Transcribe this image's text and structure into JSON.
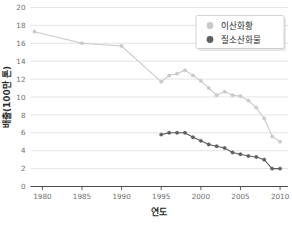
{
  "chart_data": {
    "type": "line",
    "title": "",
    "xlabel": "연도",
    "ylabel": "배출(100만 톤)",
    "xlim": [
      1978.5,
      2011
    ],
    "ylim": [
      0,
      20
    ],
    "xticks": [
      1980,
      1985,
      1990,
      1995,
      2000,
      2005,
      2010
    ],
    "yticks": [
      0,
      2,
      4,
      6,
      8,
      10,
      12,
      14,
      16,
      18,
      20
    ],
    "grid": "horizontal",
    "legend_position": "top-right",
    "series": [
      {
        "name": "이산화황",
        "color": "#c9c9c9",
        "marker": "circle",
        "x": [
          1979,
          1985,
          1990,
          1995,
          1996,
          1997,
          1998,
          1999,
          2000,
          2001,
          2002,
          2003,
          2004,
          2005,
          2006,
          2007,
          2008,
          2009,
          2010
        ],
        "values": [
          17.3,
          16.0,
          15.7,
          11.7,
          12.4,
          12.6,
          13.0,
          12.4,
          11.8,
          11.0,
          10.2,
          10.6,
          10.2,
          10.1,
          9.6,
          8.8,
          7.6,
          5.6,
          5.0
        ]
      },
      {
        "name": "질소산화물",
        "color": "#5e5e5e",
        "marker": "circle",
        "x": [
          1995,
          1996,
          1997,
          1998,
          1999,
          2000,
          2001,
          2002,
          2003,
          2004,
          2005,
          2006,
          2007,
          2008,
          2009,
          2010
        ],
        "values": [
          5.8,
          6.0,
          6.0,
          6.0,
          5.5,
          5.1,
          4.7,
          4.5,
          4.3,
          3.8,
          3.6,
          3.4,
          3.3,
          3.0,
          2.0,
          2.0
        ]
      }
    ]
  },
  "legend": {
    "items": [
      {
        "label": "이산화황",
        "color": "#c9c9c9"
      },
      {
        "label": "질소산화물",
        "color": "#5e5e5e"
      }
    ]
  },
  "axes": {
    "x_title": "연도",
    "y_title": "배출(100만 톤)",
    "x_tick_labels": [
      "1980",
      "1985",
      "1990",
      "1995",
      "2000",
      "2005",
      "2010"
    ],
    "y_tick_labels": [
      "0",
      "2",
      "4",
      "6",
      "8",
      "10",
      "12",
      "14",
      "16",
      "18",
      "20"
    ]
  }
}
